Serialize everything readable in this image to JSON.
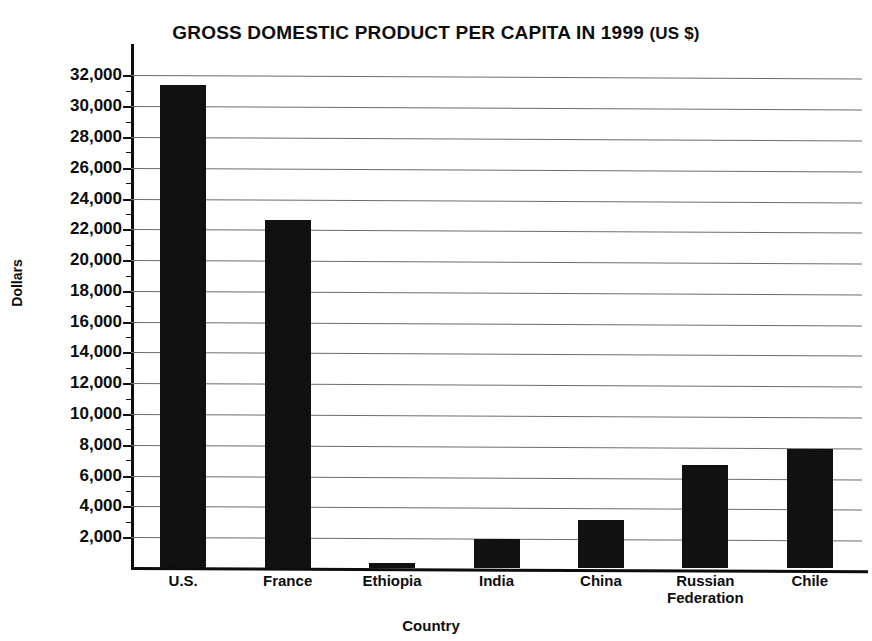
{
  "chart_data": {
    "type": "bar",
    "title": "GROSS DOMESTIC PRODUCT PER CAPITA IN 1999 (US $)",
    "title_main": "GROSS DOMESTIC PRODUCT PER CAPITA IN 1999",
    "title_suffix": "(US $)",
    "xlabel": "Country",
    "ylabel": "Dollars",
    "categories": [
      "U.S.",
      "France",
      "Ethiopia",
      "India",
      "China",
      "Russian Federation",
      "Chile"
    ],
    "category_lines": [
      [
        "U.S."
      ],
      [
        "France"
      ],
      [
        "Ethiopia"
      ],
      [
        "India"
      ],
      [
        "China"
      ],
      [
        "Russian",
        "Federation"
      ],
      [
        "Chile"
      ]
    ],
    "values": [
      31400,
      22600,
      350,
      1900,
      3100,
      6700,
      7700
    ],
    "ylim": [
      0,
      33000
    ],
    "ytick_values": [
      2000,
      4000,
      6000,
      8000,
      10000,
      12000,
      14000,
      16000,
      18000,
      20000,
      22000,
      24000,
      26000,
      28000,
      30000,
      32000
    ],
    "ytick_labels": [
      "2,000",
      "4,000",
      "6,000",
      "8,000",
      "10,000",
      "12,000",
      "14,000",
      "16,000",
      "18,000",
      "20,000",
      "22,000",
      "24,000",
      "26,000",
      "28,000",
      "30,000",
      "32,000"
    ],
    "grid": true,
    "grid_axis": "y",
    "legend": null,
    "bar_color": "#111111",
    "axis_color": "#0d0d0d",
    "grid_color": "#6d6d6d",
    "background": "#ffffff"
  }
}
